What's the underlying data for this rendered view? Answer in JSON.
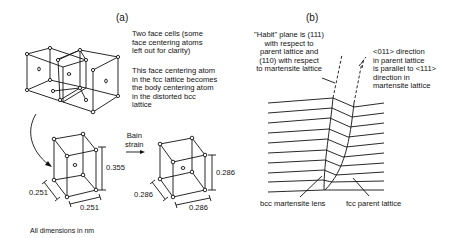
{
  "panel_a": {
    "title": "(a)",
    "note_two_face_cells": "Two face cells (some\nface centering atoms\nleft out for clarity)",
    "note_face_center": "This face centering atom\nin the fcc lattice becomes\nthe body centering atom\nin the distorted bcc\nlattice",
    "bain_label": "Bain\nstrain",
    "fcc_cell_dims": {
      "height": "0.355",
      "depth": "0.251",
      "width": "0.251"
    },
    "bcc_cell_dims": {
      "height": "0.286",
      "depth": "0.286",
      "width": "0.286"
    },
    "units_note": "All dimensions in nm"
  },
  "panel_b": {
    "title": "(b)",
    "habit_note": "\"Habit\" plane is (111)\nwith respect to\nparent lattice and\n(110) with respect\nto martensite lattice",
    "direction_note": "<011> direction\nin parent lattice\nis parallel to <111>\ndirection in\nmartensite lattice",
    "lens_label": "bcc martensite lens",
    "parent_label": "fcc parent lattice"
  }
}
